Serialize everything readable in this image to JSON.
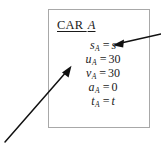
{
  "figure": {
    "title_text": "CAR ",
    "title_italic": "A",
    "box_border_color": "#a8a8a8",
    "arrow_color": "#111111",
    "background_color": "#ffffff",
    "equations": [
      {
        "var": "s",
        "sub": "A",
        "op": "=",
        "value": "s"
      },
      {
        "var": "u",
        "sub": "A",
        "op": "=",
        "value": "30"
      },
      {
        "var": "v",
        "sub": "A",
        "op": "=",
        "value": "30"
      },
      {
        "var": "a",
        "sub": "A",
        "op": "=",
        "value": "0"
      },
      {
        "var": "t",
        "sub": "A",
        "op": "=",
        "value": "t"
      }
    ],
    "annotations": [
      {
        "name": "arrow-to-displacement",
        "direction": "right-to-left",
        "points_at": "s_A = s"
      },
      {
        "name": "arrow-from-lower-left",
        "direction": "lower-left-to-upper-right",
        "points_at": "car-box"
      }
    ],
    "bottom_caption": ""
  }
}
